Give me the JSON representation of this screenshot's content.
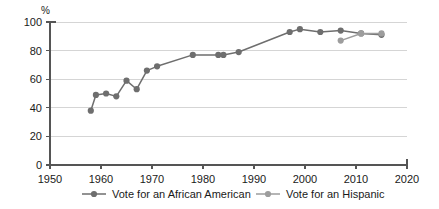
{
  "chart_data": {
    "type": "line",
    "title": "",
    "subtitle": "",
    "xlabel": "",
    "ylabel": "%",
    "unit_label": "%",
    "xlim": [
      1950,
      2020
    ],
    "ylim": [
      0,
      100
    ],
    "x_ticks": [
      1950,
      1960,
      1970,
      1980,
      1990,
      2000,
      2010,
      2020
    ],
    "y_ticks": [
      0,
      20,
      40,
      60,
      80,
      100
    ],
    "grid": "horizontal",
    "legend_position": "bottom",
    "series": [
      {
        "name": "Vote for an African American",
        "color": "#6e6e6e",
        "points": [
          {
            "x": 1958,
            "y": 38
          },
          {
            "x": 1959,
            "y": 49
          },
          {
            "x": 1961,
            "y": 50
          },
          {
            "x": 1963,
            "y": 48
          },
          {
            "x": 1965,
            "y": 59
          },
          {
            "x": 1967,
            "y": 53
          },
          {
            "x": 1969,
            "y": 66
          },
          {
            "x": 1971,
            "y": 69
          },
          {
            "x": 1978,
            "y": 77
          },
          {
            "x": 1983,
            "y": 77
          },
          {
            "x": 1984,
            "y": 77
          },
          {
            "x": 1987,
            "y": 79
          },
          {
            "x": 1997,
            "y": 93
          },
          {
            "x": 1999,
            "y": 95
          },
          {
            "x": 2003,
            "y": 93
          },
          {
            "x": 2007,
            "y": 94
          },
          {
            "x": 2011,
            "y": 92
          },
          {
            "x": 2015,
            "y": 91
          }
        ]
      },
      {
        "name": "Vote for an Hispanic",
        "color": "#9d9d9d",
        "points": [
          {
            "x": 2007,
            "y": 87
          },
          {
            "x": 2011,
            "y": 92
          },
          {
            "x": 2015,
            "y": 92
          }
        ]
      }
    ]
  },
  "legend": {
    "items": [
      {
        "label": "Vote for an African American",
        "color": "#6e6e6e"
      },
      {
        "label": "Vote for an Hispanic",
        "color": "#9d9d9d"
      }
    ]
  }
}
